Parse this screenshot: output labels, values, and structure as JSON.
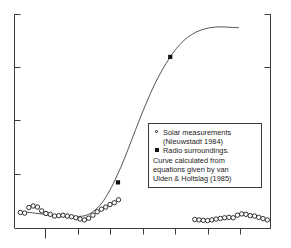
{
  "chart_data": {
    "type": "line",
    "title": "",
    "xlabel": "",
    "ylabel": "",
    "xlim": [
      0,
      24
    ],
    "ylim": [
      0,
      1
    ],
    "grid": false,
    "axes": {
      "left_ticks": [
        0.0,
        0.25,
        0.5,
        0.75,
        1.0
      ],
      "right_ticks": [
        0.0,
        0.25,
        0.5,
        0.75,
        1.0
      ],
      "bottom_ticks": [
        2,
        5,
        8,
        11,
        14,
        17,
        20,
        23
      ],
      "tick_labels_visible": false,
      "spines": [
        "left",
        "bottom",
        "right"
      ]
    },
    "series": [
      {
        "name": "Curve calculated from equations given by van Ulden & Holtslag (1985)",
        "type": "line",
        "marker": "none",
        "color": "#555555",
        "x": [
          0.9,
          2.0,
          3.2,
          4.4,
          5.6,
          6.6,
          7.4,
          8.2,
          8.9,
          9.6,
          10.3,
          11.0,
          11.7,
          12.4,
          13.1,
          13.8,
          14.6,
          15.4,
          16.2,
          17.0,
          17.8,
          18.6,
          19.4,
          20.2,
          21.0
        ],
        "y": [
          0.078,
          0.071,
          0.064,
          0.059,
          0.056,
          0.06,
          0.08,
          0.12,
          0.175,
          0.245,
          0.325,
          0.415,
          0.505,
          0.59,
          0.668,
          0.735,
          0.8,
          0.852,
          0.89,
          0.915,
          0.93,
          0.938,
          0.94,
          0.938,
          0.936
        ]
      },
      {
        "name": "Solar measurements (Nieuwstadt 1984)",
        "type": "scatter",
        "marker": "open-circle",
        "color": "#1b1b1b",
        "x": [
          0.55,
          0.95,
          1.35,
          1.75,
          2.15,
          2.55,
          2.95,
          3.35,
          3.75,
          4.15,
          4.55,
          4.95,
          5.35,
          5.75,
          6.15,
          6.55,
          6.95,
          7.35,
          7.75,
          8.15,
          8.55,
          8.95,
          9.35,
          9.75,
          16.9,
          17.3,
          17.7,
          18.1,
          18.5,
          18.9,
          19.3,
          19.7,
          20.1,
          20.5,
          20.9,
          21.3,
          21.7,
          22.1,
          22.5,
          22.9,
          23.3,
          23.7
        ],
        "y": [
          0.075,
          0.072,
          0.098,
          0.105,
          0.1,
          0.082,
          0.07,
          0.066,
          0.058,
          0.06,
          0.062,
          0.058,
          0.055,
          0.05,
          0.044,
          0.04,
          0.048,
          0.062,
          0.078,
          0.09,
          0.1,
          0.112,
          0.12,
          0.134,
          0.042,
          0.04,
          0.038,
          0.037,
          0.04,
          0.044,
          0.047,
          0.05,
          0.052,
          0.05,
          0.062,
          0.068,
          0.066,
          0.06,
          0.058,
          0.052,
          0.046,
          0.04
        ]
      },
      {
        "name": "Radio surroundings",
        "type": "scatter",
        "marker": "filled-square",
        "color": "#111111",
        "x": [
          9.7,
          14.6
        ],
        "y": [
          0.215,
          0.8
        ]
      }
    ]
  },
  "legend": {
    "entries": [
      {
        "marker": "open-circle",
        "line1": "Solar measurements",
        "line2": "(Nieuwstadt 1984)"
      },
      {
        "marker": "filled-square",
        "line1": "Radio surroundings."
      }
    ],
    "note_lines": [
      "Curve calculated from",
      "equations given by van",
      "Ulden & Holtslag (1985)"
    ]
  },
  "colors": {
    "axis": "#3c3c3c",
    "curve": "#555555",
    "marker_open": "#1b1b1b",
    "marker_filled": "#111111",
    "text": "#1b1b1b",
    "background": "#ffffff"
  }
}
